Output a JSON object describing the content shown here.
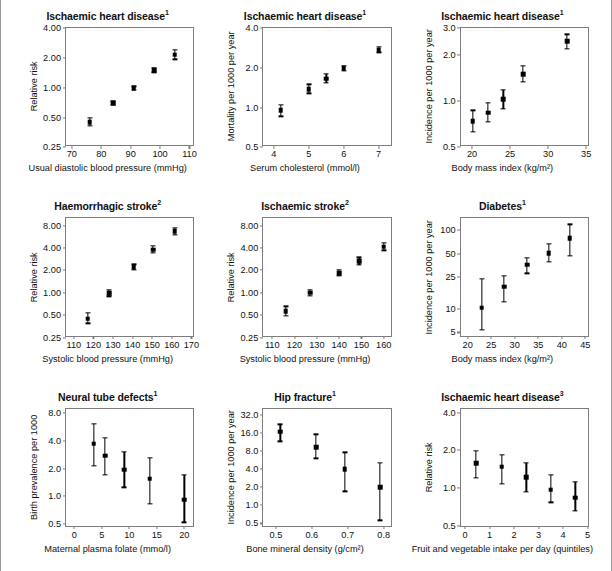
{
  "chart_data": [
    {
      "id": "ihd-dbp",
      "type": "scatter",
      "title": "Ischaemic heart disease",
      "title_sup": "1",
      "xlabel": "Usual diastolic blood pressure (mmHg)",
      "ylabel": "Relative risk",
      "yscale": "log",
      "ylim": [
        0.25,
        4.0
      ],
      "yticks": [
        0.25,
        0.5,
        1.0,
        2.0,
        4.0
      ],
      "ytick_labels": [
        "0.25",
        "0.50",
        "1.00",
        "2.00",
        "4.00"
      ],
      "xlim": [
        68,
        112
      ],
      "xticks": [
        70,
        80,
        90,
        100,
        110
      ],
      "xtick_labels": [
        "70",
        "80",
        "90",
        "100",
        "110"
      ],
      "x": [
        76,
        84,
        91,
        98,
        105
      ],
      "y": [
        0.45,
        0.7,
        0.99,
        1.5,
        2.15
      ],
      "ylo": [
        0.41,
        0.67,
        0.95,
        1.43,
        1.93
      ],
      "yhi": [
        0.5,
        0.73,
        1.03,
        1.58,
        2.4
      ]
    },
    {
      "id": "ihd-cholesterol",
      "type": "scatter",
      "title": "Ischaemic heart disease",
      "title_sup": "1",
      "xlabel": "Serum cholesterol (mmol/l)",
      "ylabel": "Mortality per 1000 per year",
      "yscale": "log",
      "ylim": [
        0.5,
        4.0
      ],
      "yticks": [
        0.5,
        1.0,
        2.0,
        4.0
      ],
      "ytick_labels": [
        "0.5",
        "1.0",
        "2.0",
        "4.0"
      ],
      "xlim": [
        3.7,
        7.4
      ],
      "xticks": [
        4,
        5,
        6,
        7
      ],
      "xtick_labels": [
        "4",
        "5",
        "6",
        "7"
      ],
      "x": [
        4.2,
        5.0,
        5.5,
        6.0,
        7.0
      ],
      "y": [
        0.95,
        1.38,
        1.65,
        1.98,
        2.75
      ],
      "ylo": [
        0.86,
        1.28,
        1.53,
        1.9,
        2.62
      ],
      "yhi": [
        1.05,
        1.5,
        1.8,
        2.07,
        2.88
      ]
    },
    {
      "id": "ihd-bmi",
      "type": "scatter",
      "title": "Ischaemic heart disease",
      "title_sup": "1",
      "xlabel": "Body mass index (kg/m²)",
      "ylabel": "Incidence per 1000 per year",
      "yscale": "log",
      "ylim": [
        0.5,
        3.0
      ],
      "yticks": [
        0.5,
        1.0,
        2.0,
        3.0
      ],
      "ytick_labels": [
        "0.5",
        "1.0",
        "2.0",
        "3.0"
      ],
      "xlim": [
        18.5,
        35.5
      ],
      "xticks": [
        20,
        25,
        30,
        35
      ],
      "xtick_labels": [
        "20",
        "25",
        "30",
        "35"
      ],
      "x": [
        20.1,
        22.1,
        24.1,
        26.7,
        32.5
      ],
      "y": [
        0.74,
        0.84,
        1.03,
        1.5,
        2.45
      ],
      "ylo": [
        0.63,
        0.73,
        0.89,
        1.33,
        2.2
      ],
      "yhi": [
        0.87,
        0.97,
        1.19,
        1.7,
        2.73
      ]
    },
    {
      "id": "haemorrhagic-stroke",
      "type": "scatter",
      "title": "Haemorrhagic stroke",
      "title_sup": "2",
      "xlabel": "Systolic blood pressure (mmHg)",
      "ylabel": "Relative risk",
      "yscale": "log",
      "ylim": [
        0.25,
        10.0
      ],
      "yticks": [
        0.25,
        0.5,
        1.0,
        2.0,
        4.0,
        8.0
      ],
      "ytick_labels": [
        "0.25",
        "0.50",
        "1.00",
        "2.00",
        "4.00",
        "8.00"
      ],
      "xlim": [
        106,
        172
      ],
      "xticks": [
        110,
        120,
        130,
        140,
        150,
        160,
        170
      ],
      "xtick_labels": [
        "110",
        "120",
        "130",
        "140",
        "150",
        "160",
        "170"
      ],
      "x": [
        117,
        128,
        140.5,
        150.5,
        161.5
      ],
      "y": [
        0.45,
        0.99,
        2.2,
        3.8,
        6.7
      ],
      "ylo": [
        0.39,
        0.9,
        2.02,
        3.42,
        6.05
      ],
      "yhi": [
        0.54,
        1.1,
        2.42,
        4.25,
        7.45
      ]
    },
    {
      "id": "ischaemic-stroke",
      "type": "scatter",
      "title": "Ischaemic stroke",
      "title_sup": "2",
      "xlabel": "Systolic blood pressure (mmHg)",
      "ylabel": "Relative risk",
      "yscale": "log",
      "ylim": [
        0.25,
        10.0
      ],
      "yticks": [
        0.25,
        0.5,
        1.0,
        2.0,
        4.0,
        8.0
      ],
      "ytick_labels": [
        "0.25",
        "0.50",
        "1.00",
        "2.00",
        "4.00",
        "8.00"
      ],
      "xlim": [
        106,
        164
      ],
      "xticks": [
        110,
        120,
        130,
        140,
        150,
        160
      ],
      "xtick_labels": [
        "110",
        "120",
        "130",
        "140",
        "150",
        "160"
      ],
      "x": [
        116,
        127,
        140,
        149,
        160
      ],
      "y": [
        0.57,
        1.0,
        1.85,
        2.65,
        4.15
      ],
      "ylo": [
        0.49,
        0.92,
        1.68,
        2.35,
        3.7
      ],
      "yhi": [
        0.66,
        1.09,
        2.05,
        3.0,
        4.65
      ]
    },
    {
      "id": "diabetes-bmi",
      "type": "scatter",
      "title": "Diabetes",
      "title_sup": "1",
      "xlabel": "Body mass index (kg/m²)",
      "ylabel": "Incidence per 1000 per year",
      "yscale": "log",
      "ylim": [
        4.3,
        140
      ],
      "yticks": [
        5,
        10,
        25,
        50,
        100
      ],
      "ytick_labels": [
        "5",
        "10",
        "25",
        "50",
        "100"
      ],
      "xlim": [
        18.5,
        46
      ],
      "xticks": [
        20,
        25,
        30,
        35,
        40,
        45
      ],
      "xtick_labels": [
        "20",
        "25",
        "30",
        "35",
        "40",
        "45"
      ],
      "x": [
        23.0,
        27.7,
        32.6,
        37.2,
        41.7
      ],
      "y": [
        10.3,
        19.0,
        36.0,
        51.0,
        78.0
      ],
      "ylo": [
        5.4,
        12.3,
        28.0,
        39.0,
        47.0
      ],
      "yhi": [
        24.0,
        26.0,
        44.0,
        67.0,
        117.0
      ]
    },
    {
      "id": "neural-tube-defects",
      "type": "scatter",
      "title": "Neural tube defects",
      "title_sup": "1",
      "xlabel": "Maternal plasma folate (mmo/l)",
      "ylabel": "Birth prevalence per 1000",
      "yscale": "log",
      "ylim": [
        0.45,
        9.0
      ],
      "yticks": [
        0.5,
        1.0,
        2.0,
        4.0,
        8.0
      ],
      "ytick_labels": [
        "0.5",
        "1.0",
        "2.0",
        "4.0",
        "8.0"
      ],
      "xlim": [
        -1.5,
        22
      ],
      "xticks": [
        0,
        5,
        10,
        15,
        20
      ],
      "xtick_labels": [
        "0",
        "5",
        "10",
        "15",
        "20"
      ],
      "x": [
        3.5,
        5.6,
        9.1,
        13.7,
        20.0
      ],
      "y": [
        3.75,
        2.75,
        1.95,
        1.55,
        0.92
      ],
      "ylo": [
        2.15,
        1.7,
        1.25,
        0.83,
        0.52
      ],
      "yhi": [
        6.1,
        4.3,
        3.05,
        2.6,
        1.7
      ]
    },
    {
      "id": "hip-fracture",
      "type": "scatter",
      "title": "Hip fracture",
      "title_sup": "1",
      "xlabel": "Bone mineral density (g/cm²)",
      "ylabel": "Incidence per 1000 per year",
      "yscale": "log",
      "ylim": [
        0.42,
        40
      ],
      "yticks": [
        0.5,
        1.0,
        2.0,
        4.0,
        8.0,
        16.0,
        32.0
      ],
      "ytick_labels": [
        "0.5",
        "1.0",
        "2.0",
        "4.0",
        "8.0",
        "16.0",
        "32.0"
      ],
      "xlim": [
        0.465,
        0.825
      ],
      "xticks": [
        0.5,
        0.6,
        0.7,
        0.8
      ],
      "xtick_labels": [
        "0.5",
        "0.6",
        "0.7",
        "0.8"
      ],
      "x": [
        0.512,
        0.612,
        0.692,
        0.79
      ],
      "y": [
        16.5,
        9.2,
        4.0,
        2.0
      ],
      "ylo": [
        11.5,
        6.0,
        1.7,
        0.56
      ],
      "yhi": [
        22.0,
        15.0,
        7.5,
        5.0
      ]
    },
    {
      "id": "ihd-fruit-veg",
      "type": "scatter",
      "title": "Ischaemic heart disease",
      "title_sup": "3",
      "xlabel": "Fruit and vegetable intake per day (quintiles)",
      "ylabel": "Relative risk",
      "yscale": "log",
      "ylim": [
        0.48,
        4.3
      ],
      "yticks": [
        0.5,
        1.0,
        2.0,
        4.0
      ],
      "ytick_labels": [
        "0.5",
        "1.0",
        "2.0",
        "4.0"
      ],
      "xlim": [
        -0.18,
        5.1
      ],
      "xticks": [
        0,
        1,
        2,
        3,
        4,
        5
      ],
      "xtick_labels": [
        "0",
        "1",
        "2",
        "3",
        "4",
        "5"
      ],
      "x": [
        0.45,
        1.5,
        2.5,
        3.5,
        4.5
      ],
      "y": [
        1.58,
        1.48,
        1.22,
        0.97,
        0.84
      ],
      "ylo": [
        1.21,
        1.08,
        0.93,
        0.77,
        0.66
      ],
      "yhi": [
        1.97,
        1.85,
        1.58,
        1.28,
        1.12
      ]
    }
  ]
}
